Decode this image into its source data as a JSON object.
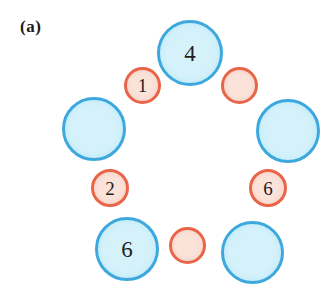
{
  "figure": {
    "panel_label": "(a)",
    "background_color": "#ffffff",
    "width": 331,
    "height": 301
  },
  "palette": {
    "big_fill": "#d5f2fb",
    "big_stroke": "#3da8dd",
    "small_fill": "#fbe3da",
    "small_stroke": "#e9654a",
    "label_color": "#1e1e22"
  },
  "diagram": {
    "type": "ring-of-circles",
    "nodes": [
      {
        "id": "big-top",
        "shape": "circle",
        "size": "big",
        "label": "4",
        "x": 157,
        "y": 20,
        "d": 66
      },
      {
        "id": "small-upper-left",
        "shape": "circle",
        "size": "small",
        "label": "1",
        "x": 124,
        "y": 67,
        "d": 37
      },
      {
        "id": "small-upper-right",
        "shape": "circle",
        "size": "small",
        "label": "",
        "x": 221,
        "y": 67,
        "d": 37
      },
      {
        "id": "big-left",
        "shape": "circle",
        "size": "big",
        "label": "",
        "x": 62,
        "y": 97,
        "d": 64
      },
      {
        "id": "big-right",
        "shape": "circle",
        "size": "big",
        "label": "",
        "x": 256,
        "y": 99,
        "d": 64
      },
      {
        "id": "small-lower-left",
        "shape": "circle",
        "size": "small",
        "label": "2",
        "x": 91,
        "y": 169,
        "d": 38
      },
      {
        "id": "small-lower-right",
        "shape": "circle",
        "size": "small",
        "label": "6",
        "x": 249,
        "y": 169,
        "d": 38
      },
      {
        "id": "big-bottom-left",
        "shape": "circle",
        "size": "big",
        "label": "6",
        "x": 95,
        "y": 217,
        "d": 64
      },
      {
        "id": "small-bottom",
        "shape": "circle",
        "size": "small",
        "label": "",
        "x": 169,
        "y": 227,
        "d": 37
      },
      {
        "id": "big-bottom-right",
        "shape": "circle",
        "size": "big",
        "label": "",
        "x": 221,
        "y": 221,
        "d": 63
      }
    ]
  }
}
